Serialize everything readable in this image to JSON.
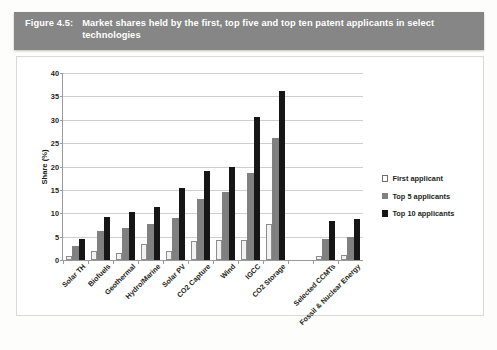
{
  "caption": {
    "label": "Figure 4.5:",
    "text": "Market shares held by the first, top five and top ten patent applicants in select technologies"
  },
  "colors": {
    "caption_bar": "#868686",
    "caption_text": "#ffffff",
    "series_first": "#f2f2f2",
    "series_top5": "#808080",
    "series_top10": "#161616",
    "gridline": "#cfcfcf",
    "axis": "#9a9a9a"
  },
  "legend": {
    "position": "right",
    "items": [
      {
        "label": "First applicant",
        "swatch": "s0"
      },
      {
        "label": "Top 5 applicants",
        "swatch": "s1"
      },
      {
        "label": "Top 10 applicants",
        "swatch": "s2"
      }
    ]
  },
  "footer_note": "",
  "chart_data": {
    "type": "bar",
    "title": "Market shares held by the first, top five and top ten patent applicants in select technologies",
    "xlabel": "",
    "ylabel": "Share (%)",
    "ylim": [
      0,
      40
    ],
    "yticks": [
      0,
      5,
      10,
      15,
      20,
      25,
      30,
      35,
      40
    ],
    "ytick_labels": [
      "0",
      "5",
      "10",
      "15",
      "20",
      "25",
      "30",
      "35",
      "40"
    ],
    "grid": true,
    "categories": [
      "Solar TH",
      "Biofuels",
      "Geothermal",
      "Hydro/Marine",
      "Solar PV",
      "CO2 Capture",
      "Wind",
      "IGCC",
      "CO2 Storage",
      "",
      "Selected CCMTs",
      "Fossil & Nuclear Energy"
    ],
    "series": [
      {
        "name": "First applicant",
        "values": [
          0.8,
          2.0,
          1.4,
          3.4,
          2.0,
          4.0,
          4.3,
          4.2,
          7.8,
          0,
          0.8,
          1.0
        ]
      },
      {
        "name": "Top 5 applicants",
        "values": [
          3.0,
          6.1,
          6.8,
          7.8,
          9.0,
          13.0,
          14.5,
          18.7,
          26.1,
          0,
          4.6,
          5.0
        ]
      },
      {
        "name": "Top 10 applicants",
        "values": [
          4.6,
          9.3,
          10.2,
          11.4,
          15.4,
          19.0,
          20.0,
          30.6,
          36.2,
          0,
          8.3,
          8.7
        ]
      }
    ]
  }
}
